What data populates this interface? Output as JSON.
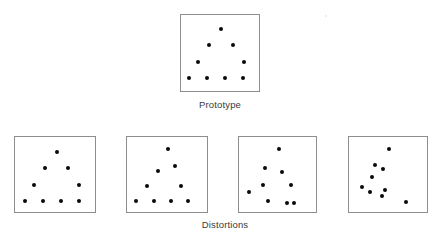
{
  "figure": {
    "background_color": "#ffffff",
    "box_border_color": "#8d8d8d",
    "dot_color": "#0a0a0a",
    "caption_color": "#3a3a3a",
    "prototype_caption": "Prototype",
    "distortions_caption": "Distortions"
  },
  "prototype": {
    "label": "Prototype",
    "box": {
      "x": 180,
      "y": 14,
      "w": 80,
      "h": 78
    },
    "dot_count": 9,
    "dots": [
      {
        "x": 40,
        "y": 14
      },
      {
        "x": 28,
        "y": 30
      },
      {
        "x": 52,
        "y": 30
      },
      {
        "x": 17,
        "y": 47
      },
      {
        "x": 63,
        "y": 47
      },
      {
        "x": 8,
        "y": 63
      },
      {
        "x": 26,
        "y": 63
      },
      {
        "x": 44,
        "y": 63
      },
      {
        "x": 62,
        "y": 63
      }
    ]
  },
  "distortions": {
    "label": "Distortions",
    "items": [
      {
        "name": "distortion-1",
        "box": {
          "x": 14,
          "y": 136,
          "w": 82,
          "h": 77
        },
        "dot_count": 9,
        "dots": [
          {
            "x": 42,
            "y": 15
          },
          {
            "x": 30,
            "y": 31
          },
          {
            "x": 53,
            "y": 31
          },
          {
            "x": 19,
            "y": 48
          },
          {
            "x": 64,
            "y": 48
          },
          {
            "x": 10,
            "y": 64
          },
          {
            "x": 28,
            "y": 64
          },
          {
            "x": 46,
            "y": 64
          },
          {
            "x": 64,
            "y": 64
          }
        ]
      },
      {
        "name": "distortion-2",
        "box": {
          "x": 126,
          "y": 136,
          "w": 82,
          "h": 77
        },
        "dot_count": 9,
        "dots": [
          {
            "x": 41,
            "y": 12
          },
          {
            "x": 31,
            "y": 34
          },
          {
            "x": 48,
            "y": 29
          },
          {
            "x": 20,
            "y": 49
          },
          {
            "x": 54,
            "y": 49
          },
          {
            "x": 9,
            "y": 64
          },
          {
            "x": 27,
            "y": 64
          },
          {
            "x": 44,
            "y": 64
          },
          {
            "x": 61,
            "y": 64
          }
        ]
      },
      {
        "name": "distortion-3",
        "box": {
          "x": 238,
          "y": 136,
          "w": 79,
          "h": 77
        },
        "dot_count": 9,
        "dots": [
          {
            "x": 40,
            "y": 12
          },
          {
            "x": 26,
            "y": 31
          },
          {
            "x": 43,
            "y": 35
          },
          {
            "x": 24,
            "y": 48
          },
          {
            "x": 52,
            "y": 48
          },
          {
            "x": 10,
            "y": 55
          },
          {
            "x": 29,
            "y": 64
          },
          {
            "x": 48,
            "y": 66
          },
          {
            "x": 55,
            "y": 66
          }
        ]
      },
      {
        "name": "distortion-4",
        "box": {
          "x": 348,
          "y": 136,
          "w": 80,
          "h": 77
        },
        "dot_count": 9,
        "dots": [
          {
            "x": 40,
            "y": 12
          },
          {
            "x": 26,
            "y": 28
          },
          {
            "x": 34,
            "y": 32
          },
          {
            "x": 23,
            "y": 40
          },
          {
            "x": 13,
            "y": 50
          },
          {
            "x": 21,
            "y": 55
          },
          {
            "x": 36,
            "y": 53
          },
          {
            "x": 33,
            "y": 59
          },
          {
            "x": 57,
            "y": 65
          }
        ]
      }
    ]
  }
}
